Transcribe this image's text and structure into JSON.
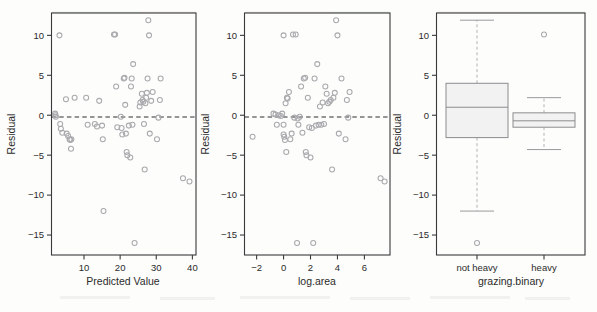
{
  "figure": {
    "background_color": "#fdfdfb",
    "point_color": "#a9a9ae",
    "frame_color": "#3a3a3c",
    "box_fill_color": "#f2f2f2",
    "panel_count": 3
  },
  "chart_data": [
    {
      "type": "scatter",
      "title": "",
      "xlabel": "Predicted Value",
      "ylabel": "Residual",
      "xlim": [
        1,
        41
      ],
      "ylim": [
        -17.5,
        12.8
      ],
      "xticks": [
        10,
        20,
        30,
        40
      ],
      "yticks": [
        10,
        5,
        0,
        -5,
        -10,
        -15
      ],
      "grid": false,
      "legend": "none",
      "annotations": [
        {
          "kind": "reference-line",
          "orientation": "horizontal",
          "value": 0,
          "style": "dashed"
        }
      ],
      "x": [
        2.0,
        2.1,
        2.2,
        3.2,
        3.4,
        3.6,
        4.0,
        5.0,
        5.2,
        5.6,
        6.0,
        6.2,
        6.4,
        6.5,
        7.4,
        10.6,
        11.0,
        13.0,
        13.6,
        14.2,
        15.0,
        15.2,
        15.4,
        18.3,
        18.6,
        18.9,
        19.2,
        20.2,
        20.4,
        20.6,
        21.0,
        21.2,
        21.4,
        21.6,
        21.8,
        22.0,
        22.4,
        22.8,
        23.0,
        23.2,
        23.4,
        23.6,
        24.0,
        25.4,
        25.6,
        26.0,
        26.2,
        26.4,
        26.6,
        26.8,
        27.0,
        27.2,
        27.4,
        27.6,
        27.8,
        28.0,
        28.2,
        28.6,
        29.0,
        30.2,
        30.6,
        31.0,
        31.2,
        37.4,
        39.2
      ],
      "y": [
        0.2,
        0.0,
        -0.2,
        10.0,
        -1.1,
        -1.7,
        -2.2,
        2.0,
        -2.3,
        -2.6,
        -3.0,
        -3.1,
        -4.2,
        -3.0,
        2.2,
        2.2,
        -1.2,
        -1.1,
        -1.4,
        1.8,
        -1.3,
        -3.0,
        -12.0,
        10.1,
        10.1,
        3.6,
        -1.5,
        -0.2,
        -1.6,
        -2.4,
        4.6,
        4.7,
        1.3,
        -2.3,
        -4.6,
        -5.0,
        -1.3,
        -5.3,
        3.6,
        4.6,
        -1.2,
        6.4,
        -16.0,
        1.1,
        1.6,
        2.7,
        1.9,
        1.7,
        -1.1,
        -6.8,
        1.5,
        2.2,
        2.8,
        4.6,
        11.9,
        10.0,
        -2.3,
        1.8,
        2.9,
        -3.0,
        -0.3,
        1.9,
        4.6,
        -7.9,
        -8.3
      ]
    },
    {
      "type": "scatter",
      "title": "",
      "xlabel": "log.area",
      "ylabel": "Residual",
      "xlim": [
        -2.9,
        7.9
      ],
      "ylim": [
        -17.5,
        12.8
      ],
      "xticks": [
        -2,
        0,
        2,
        4,
        6
      ],
      "yticks": [
        10,
        5,
        0,
        -5,
        -10,
        -15
      ],
      "grid": false,
      "legend": "none",
      "annotations": [
        {
          "kind": "reference-line",
          "orientation": "horizontal",
          "value": 0,
          "style": "dashed"
        }
      ],
      "x": [
        -2.3,
        -0.75,
        -0.6,
        -0.5,
        -0.35,
        -0.2,
        -0.1,
        0.0,
        0.0,
        0.0,
        0.05,
        0.1,
        0.15,
        0.2,
        0.25,
        0.3,
        0.4,
        0.5,
        0.6,
        0.7,
        0.8,
        0.9,
        1.0,
        1.05,
        1.1,
        1.2,
        1.3,
        1.4,
        1.5,
        1.6,
        1.65,
        1.7,
        1.8,
        1.9,
        2.0,
        2.1,
        2.2,
        2.3,
        2.4,
        2.5,
        2.6,
        2.7,
        2.8,
        2.9,
        3.0,
        3.1,
        3.2,
        3.3,
        3.4,
        3.5,
        3.6,
        3.7,
        3.8,
        3.9,
        4.0,
        4.1,
        4.3,
        4.6,
        4.7,
        4.8,
        4.9,
        7.2,
        7.5
      ],
      "y": [
        -2.7,
        0.2,
        0.1,
        -1.2,
        0.0,
        -0.1,
        0.2,
        10.0,
        -1.2,
        -2.4,
        -2.7,
        -3.1,
        1.5,
        -4.6,
        2.2,
        2.1,
        2.9,
        -3.0,
        -2.3,
        10.1,
        -0.3,
        10.1,
        -16.0,
        -0.4,
        -1.2,
        -0.2,
        3.6,
        -2.2,
        4.6,
        4.7,
        -4.6,
        -5.0,
        2.2,
        -1.5,
        -5.3,
        -1.6,
        -16.0,
        4.6,
        -1.3,
        6.4,
        -1.2,
        1.1,
        -1.2,
        1.6,
        -1.1,
        3.6,
        2.7,
        1.5,
        1.7,
        1.9,
        -6.8,
        2.2,
        2.8,
        11.9,
        10.0,
        -2.3,
        4.6,
        -3.0,
        1.9,
        -0.3,
        2.9,
        -7.9,
        -8.3
      ],
      "extra_low_x_point": {
        "x": -2.3,
        "y": -2.7
      }
    },
    {
      "type": "box",
      "title": "",
      "xlabel": "grazing.binary",
      "ylabel": "Residual",
      "ylim": [
        -17.5,
        12.8
      ],
      "yticks": [
        10,
        5,
        0,
        -5,
        -10,
        -15
      ],
      "categories": [
        "not heavy",
        "heavy"
      ],
      "grid": false,
      "legend": "none",
      "boxes": [
        {
          "category": "not heavy",
          "whisker_low": -12.0,
          "q1": -2.8,
          "median": 1.0,
          "q3": 4.0,
          "whisker_high": 11.9,
          "outliers": [
            -16.0
          ]
        },
        {
          "category": "heavy",
          "whisker_low": -4.3,
          "q1": -1.5,
          "median": -0.7,
          "q3": 0.3,
          "whisker_high": 2.2,
          "outliers": [
            10.1
          ]
        }
      ]
    }
  ]
}
